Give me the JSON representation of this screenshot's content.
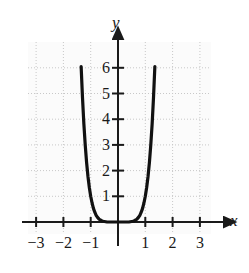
{
  "chart_data": {
    "type": "line",
    "title": "",
    "subtitle": "",
    "xlabel": "x",
    "ylabel": "y",
    "xlim": [
      -3.4,
      3.4
    ],
    "ylim": [
      -0.45,
      7.0
    ],
    "grid": true,
    "legend": null,
    "xticks": [
      -3,
      -2,
      -1,
      1,
      2,
      3
    ],
    "xtick_labels": [
      "−3",
      "−2",
      "−1",
      "1",
      "2",
      "3"
    ],
    "yticks": [
      1,
      2,
      3,
      4,
      5,
      6
    ],
    "ytick_labels": [
      "1",
      "2",
      "3",
      "4",
      "5",
      "6"
    ],
    "series": [
      {
        "name": "curve",
        "function": "y = x^6",
        "color": "#111111",
        "linewidth": 3.2,
        "x": [
          -1.45,
          -1.4,
          -1.35,
          -1.3,
          -1.25,
          -1.2,
          -1.15,
          -1.1,
          -1.05,
          -1.0,
          -0.95,
          -0.9,
          -0.85,
          -0.8,
          -0.75,
          -0.7,
          -0.65,
          -0.6,
          -0.55,
          -0.5,
          -0.4,
          -0.3,
          -0.2,
          -0.1,
          0.0,
          0.1,
          0.2,
          0.3,
          0.4,
          0.5,
          0.55,
          0.6,
          0.65,
          0.7,
          0.75,
          0.8,
          0.85,
          0.9,
          0.95,
          1.0,
          1.05,
          1.1,
          1.15,
          1.2,
          1.25,
          1.3,
          1.35,
          1.4,
          1.45
        ],
        "y": [
          9.29,
          7.53,
          6.05,
          4.83,
          3.81,
          2.99,
          2.31,
          1.77,
          1.34,
          1.0,
          0.74,
          0.53,
          0.38,
          0.26,
          0.18,
          0.12,
          0.08,
          0.05,
          0.03,
          0.02,
          0.0,
          0.0,
          0.0,
          0.0,
          0.0,
          0.0,
          0.0,
          0.0,
          0.0,
          0.02,
          0.03,
          0.05,
          0.08,
          0.12,
          0.18,
          0.26,
          0.38,
          0.53,
          0.74,
          1.0,
          1.34,
          1.77,
          2.31,
          2.99,
          3.81,
          4.83,
          6.05,
          7.53,
          9.29
        ]
      }
    ],
    "axes_style": {
      "axis_color": "#1a1a1a",
      "grid_color": "#c8c8c8",
      "plot_bg": "#fbfbfb",
      "arrow_heads": [
        "x-positive",
        "y-positive"
      ]
    }
  }
}
